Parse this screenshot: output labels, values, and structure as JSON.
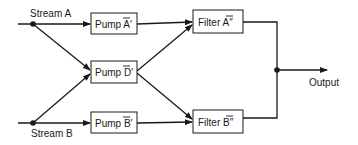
{
  "diagram": {
    "inputs": [
      {
        "id": "stream-a",
        "label": "Stream A"
      },
      {
        "id": "stream-b",
        "label": "Stream B"
      }
    ],
    "pumps": [
      {
        "id": "pump-a",
        "prefix": "Pump ",
        "symbol": "A",
        "mark": "′",
        "overbar": true
      },
      {
        "id": "pump-d",
        "prefix": "Pump ",
        "symbol": "D",
        "mark": "′",
        "overbar": true
      },
      {
        "id": "pump-b",
        "prefix": "Pump ",
        "symbol": "B",
        "mark": "′",
        "overbar": true
      }
    ],
    "filters": [
      {
        "id": "filter-a",
        "prefix": "Filter ",
        "symbol": "A",
        "mark": "″",
        "overbar": true
      },
      {
        "id": "filter-b",
        "prefix": "Filter ",
        "symbol": "B",
        "mark": "″",
        "overbar": true
      }
    ],
    "output": {
      "label": "Output"
    },
    "edges": [
      [
        "stream-a",
        "pump-a"
      ],
      [
        "stream-a",
        "pump-d"
      ],
      [
        "stream-b",
        "pump-b"
      ],
      [
        "stream-b",
        "pump-d"
      ],
      [
        "pump-a",
        "filter-a"
      ],
      [
        "pump-d",
        "filter-a"
      ],
      [
        "pump-d",
        "filter-b"
      ],
      [
        "pump-b",
        "filter-b"
      ],
      [
        "filter-a",
        "output"
      ],
      [
        "filter-b",
        "output"
      ]
    ],
    "colors": {
      "stroke": "#1a1a1a",
      "background": "#ffffff"
    }
  }
}
